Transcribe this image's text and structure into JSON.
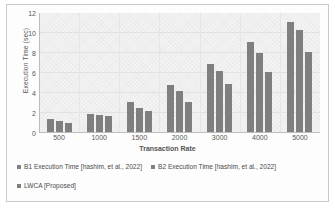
{
  "chart_data": {
    "type": "bar",
    "title": "",
    "xlabel": "Transaction Rate",
    "ylabel": "Execution Time (sec)",
    "categories": [
      "500",
      "1000",
      "1500",
      "2000",
      "3000",
      "4000",
      "5000"
    ],
    "series": [
      {
        "name": "B1 Execution Time [hashim, et al., 2022]",
        "color": "#7f7f7f",
        "values": [
          1.4,
          1.9,
          3.1,
          4.8,
          6.9,
          9.1,
          11.1
        ]
      },
      {
        "name": "B2 Execution Time [hashim, et al., 2022]",
        "color": "#7f7f7f",
        "values": [
          1.2,
          1.8,
          2.5,
          4.2,
          6.2,
          8.0,
          10.3
        ]
      },
      {
        "name": "LWCA [Proposed]",
        "color": "#7f7f7f",
        "values": [
          1.0,
          1.7,
          2.2,
          3.1,
          4.9,
          6.1,
          8.1
        ]
      }
    ],
    "ylim": [
      0,
      12
    ],
    "yticks": [
      0,
      2,
      4,
      6,
      8,
      10,
      12
    ],
    "ytick_labels": [
      "0",
      "2",
      "4",
      "6",
      "8",
      "10",
      "12"
    ],
    "grid": true,
    "legend_position": "bottom"
  },
  "legend": {
    "items": [
      "B1 Execution Time [hashim, et al., 2022]",
      "B2 Execution Time [hashim, et al., 2022]",
      "LWCA [Proposed]"
    ]
  },
  "colors": {
    "bar": "#7f7f7f",
    "plot_background": "#f3f3f3",
    "gridline": "#e2e2e2",
    "frame_border": "#c9c9c9",
    "text": "#555555"
  }
}
